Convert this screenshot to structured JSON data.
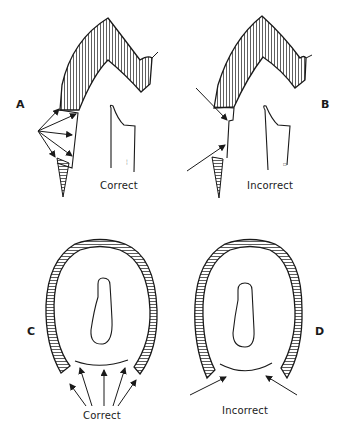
{
  "figure": {
    "panels": [
      {
        "id": "A",
        "label": "A",
        "caption": "Correct",
        "description": "Upper-left panel: a bent striated band ending in an open triangle, with five arrows radiating from one point to its inner edge, a short tapered striated strip below, and a separate outline shape to the right marked with tiny text",
        "arrow_count": 5
      },
      {
        "id": "B",
        "label": "B",
        "caption": "Incorrect",
        "description": "Upper-right panel: the same bent striated band ending in a flat face, with two long arrows pointing in from the left at steep angles, a tapered strip below, and an outline shape to the right with tiny marks",
        "arrow_count": 2
      },
      {
        "id": "C",
        "label": "C",
        "caption": "Correct",
        "description": "Lower-left panel: an oval outline edged by a striated rim that is open at the bottom, an elongated inner contour, and five arrows fanning up toward the opening",
        "arrow_count": 5
      },
      {
        "id": "D",
        "label": "D",
        "caption": "Incorrect",
        "description": "Lower-right panel: the same oval shape with its inner contour, with only two arrows coming in from the lower left and lower right toward the opening",
        "arrow_count": 2
      }
    ],
    "colors": {
      "ink": "#1a1a1a",
      "background": "#ffffff"
    }
  }
}
